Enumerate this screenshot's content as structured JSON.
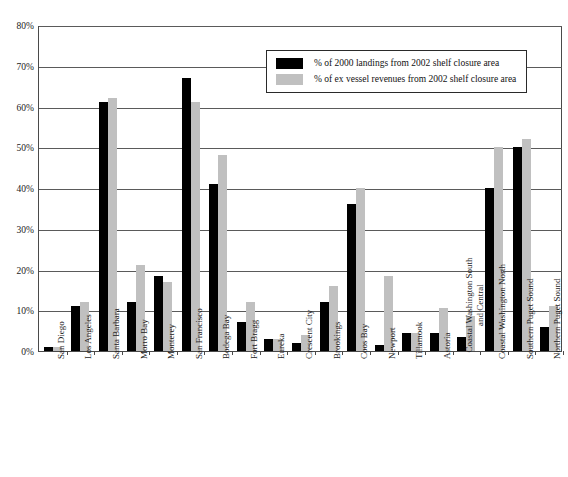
{
  "chart_data": {
    "type": "bar",
    "title": "",
    "xlabel": "",
    "ylabel": "",
    "ylim": [
      0,
      80
    ],
    "y_ticks": [
      "0%",
      "10%",
      "20%",
      "30%",
      "40%",
      "50%",
      "60%",
      "70%",
      "80%"
    ],
    "grid": true,
    "legend_position": "top-right-inside",
    "categories": [
      "San Diego",
      "Los Angeles",
      "Santa Barbara",
      "Morro Bay",
      "Monterey",
      "San Francisco",
      "Bodega Bay",
      "Fort Bragg",
      "Eureka",
      "Crescent City",
      "Brookings",
      "Coos Bay",
      "Newport",
      "Tillamook",
      "Astoria",
      "Coastal Washington South and Central",
      "Coastal Washington North",
      "Southern Puget Sound",
      "Northern Puget Sound"
    ],
    "series": [
      {
        "name": "% of 2000 landings from 2002 shelf closure area",
        "color": "#000000",
        "values": [
          1,
          11,
          61,
          12,
          18.5,
          67,
          41,
          7,
          3,
          2,
          12,
          36,
          1.5,
          4.5,
          4.5,
          3.5,
          40,
          50,
          6
        ]
      },
      {
        "name": "% of ex vessel revenues from 2002 shelf closure area",
        "color": "#c0c0c0",
        "values": [
          1,
          12,
          62,
          21,
          17,
          61,
          48,
          12,
          3,
          4,
          16,
          40,
          18.5,
          4.5,
          10.5,
          8.5,
          50,
          52,
          11
        ]
      }
    ]
  },
  "legend": {
    "entries": [
      "% of 2000 landings from 2002 shelf closure area",
      "% of ex vessel revenues from 2002 shelf closure area"
    ]
  }
}
